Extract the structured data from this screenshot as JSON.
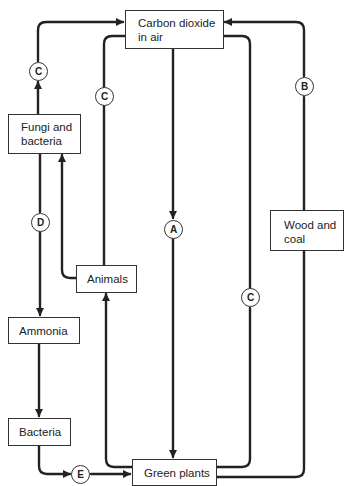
{
  "diagram": {
    "title_fragment": "",
    "type": "carbon and nitrogen cycle flow diagram",
    "nodes": {
      "co2": {
        "line1": "Carbon dioxide",
        "line2": "in air"
      },
      "fungi": {
        "line1": "Fungi and",
        "line2": "bacteria"
      },
      "animals": {
        "label": "Animals"
      },
      "ammonia": {
        "label": "Ammonia"
      },
      "bacteria": {
        "label": "Bacteria"
      },
      "green_plants": {
        "label": "Green plants"
      },
      "wood_coal": {
        "line1": "Wood and",
        "line2": "coal"
      }
    },
    "process_labels": {
      "c_fungi": "C",
      "c_animals": "C",
      "c_plants": "C",
      "a": "A",
      "b": "B",
      "d": "D",
      "e": "E"
    },
    "edges": [
      {
        "from": "Fungi and bacteria",
        "to": "Carbon dioxide in air",
        "label": "C"
      },
      {
        "from": "Animals",
        "to": "Carbon dioxide in air",
        "label": "C"
      },
      {
        "from": "Carbon dioxide in air",
        "to": "Green plants",
        "label": "A"
      },
      {
        "from": "Green plants",
        "to": "Carbon dioxide in air",
        "label": "C"
      },
      {
        "from": "Wood and coal",
        "to": "Carbon dioxide in air",
        "label": "B"
      },
      {
        "from": "Green plants",
        "to": "Wood and coal",
        "label": ""
      },
      {
        "from": "Fungi and bacteria",
        "to": "Ammonia",
        "label": "D"
      },
      {
        "from": "Animals",
        "to": "Fungi and bacteria",
        "label": ""
      },
      {
        "from": "Green plants",
        "to": "Animals",
        "label": ""
      },
      {
        "from": "Ammonia",
        "to": "Bacteria",
        "label": ""
      },
      {
        "from": "Bacteria",
        "to": "Green plants",
        "label": "E"
      }
    ]
  }
}
